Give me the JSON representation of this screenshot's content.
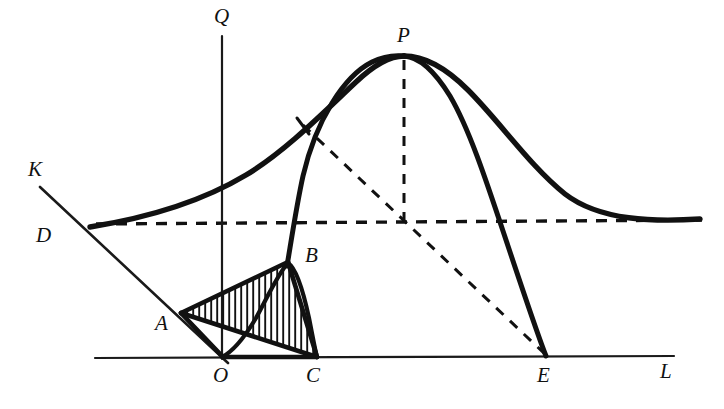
{
  "figure": {
    "background_color": "#ffffff",
    "ink_color": "#111111",
    "canvas": {
      "width": 724,
      "height": 409
    }
  },
  "axes": [
    {
      "id": "q-axis",
      "label": "Q",
      "orientation": "vertical",
      "label_x": 214,
      "label_y": 23,
      "x1": 222,
      "y1": 36,
      "x2": 222,
      "y2": 359
    },
    {
      "id": "l-axis",
      "label": "L",
      "orientation": "horizontal",
      "label_x": 660,
      "label_y": 378,
      "x1": 95,
      "y1": 357,
      "x2": 674,
      "y2": 357
    },
    {
      "id": "k-axis",
      "label": "K",
      "orientation": "diagonal",
      "label_x": 28,
      "label_y": 176,
      "x1": 40,
      "y1": 187,
      "x2": 226,
      "y2": 362
    }
  ],
  "points": [
    {
      "name": "Q",
      "label": "Q",
      "x": 222,
      "y": 36,
      "label_x": 214,
      "label_y": 23
    },
    {
      "name": "K",
      "label": "K",
      "x": 40,
      "y": 187,
      "label_x": 28,
      "label_y": 176
    },
    {
      "name": "D",
      "label": "D",
      "x": 90,
      "y": 227,
      "label_x": 36,
      "label_y": 242
    },
    {
      "name": "A",
      "label": "A",
      "x": 181,
      "y": 313,
      "label_x": 155,
      "label_y": 330
    },
    {
      "name": "B",
      "label": "B",
      "x": 288,
      "y": 262,
      "label_x": 305,
      "label_y": 262
    },
    {
      "name": "O",
      "label": "O",
      "x": 222,
      "y": 357,
      "label_x": 213,
      "label_y": 382
    },
    {
      "name": "C",
      "label": "C",
      "x": 317,
      "y": 357,
      "label_x": 306,
      "label_y": 382
    },
    {
      "name": "P",
      "label": "P",
      "x": 404,
      "y": 56,
      "label_x": 397,
      "label_y": 42
    },
    {
      "name": "E",
      "label": "E",
      "x": 546,
      "y": 357,
      "label_x": 537,
      "label_y": 382
    },
    {
      "name": "L",
      "label": "L",
      "x": 674,
      "y": 357,
      "label_x": 660,
      "label_y": 378
    }
  ],
  "curves": [
    {
      "name": "wide-bell-curve",
      "style": "solid-thick",
      "description": "Broad flat bell curve from D rising to peak P and decaying to the right asymptote"
    },
    {
      "name": "narrow-bell-curve",
      "style": "solid-thick",
      "description": "Tall narrow curve rising from B through the dashed line up to P then falling steeply to E"
    },
    {
      "name": "small-bell-curve",
      "style": "solid-medium",
      "description": "Small curve from O rising to apex B and falling to C"
    }
  ],
  "dashed_lines": [
    {
      "name": "horizontal-asymptote",
      "from": "D",
      "to": "right-edge",
      "x1": 96,
      "y1": 224,
      "x2": 702,
      "y2": 220
    },
    {
      "name": "p-vertical-drop",
      "from": "P",
      "to": "axis-crossing",
      "x1": 404,
      "y1": 60,
      "x2": 404,
      "y2": 223
    },
    {
      "name": "p-to-e-diagonal",
      "from": "P",
      "to": "E",
      "x1": 302,
      "y1": 124,
      "x2": 546,
      "y2": 355
    }
  ],
  "shaded_regions": [
    {
      "name": "hatched-triangle-abc",
      "vertices": [
        "A",
        "B",
        "C"
      ],
      "fill": "vertical-hatching",
      "hatch_spacing": 6,
      "hatch_color": "#111111"
    }
  ],
  "polygon_edges": [
    {
      "name": "edge-a-b",
      "from": "A",
      "to": "B"
    },
    {
      "name": "edge-b-c",
      "from": "B",
      "to": "C"
    },
    {
      "name": "edge-c-a",
      "from": "C",
      "to": "A"
    },
    {
      "name": "edge-a-o",
      "from": "A",
      "to": "O"
    },
    {
      "name": "edge-o-c",
      "from": "O",
      "to": "C"
    }
  ],
  "tick_marks": [
    {
      "name": "tangent-tick-on-wide-curve",
      "x1": 298,
      "y1": 119,
      "x2": 310,
      "y2": 133
    }
  ]
}
